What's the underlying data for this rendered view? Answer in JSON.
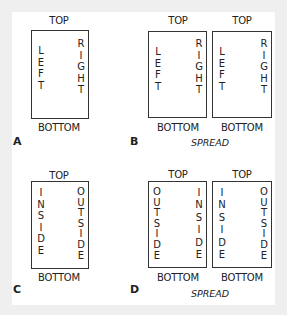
{
  "diagrams": {
    "a": {
      "label": "A",
      "top": "TOP",
      "bottom": "BOTTOM",
      "pages": [
        {
          "left": [
            "L",
            "E",
            "F",
            "T"
          ],
          "right": [
            "R",
            "I",
            "G",
            "H",
            "T"
          ]
        }
      ]
    },
    "b": {
      "label": "B",
      "caption": "SPREAD",
      "pages": [
        {
          "top": "TOP",
          "bottom": "BOTTOM",
          "left": [
            "L",
            "E",
            "F",
            "T"
          ],
          "right": [
            "R",
            "I",
            "G",
            "H",
            "T"
          ]
        },
        {
          "top": "TOP",
          "bottom": "BOTTOM",
          "left": [
            "L",
            "E",
            "F",
            "T"
          ],
          "right": [
            "R",
            "I",
            "G",
            "H",
            "T"
          ]
        }
      ]
    },
    "c": {
      "label": "C",
      "top": "TOP",
      "bottom": "BOTTOM",
      "pages": [
        {
          "left": [
            "I",
            "N",
            "S",
            "I",
            "D",
            "E"
          ],
          "right": [
            "O",
            "U",
            "T",
            "S",
            "I",
            "D",
            "E"
          ]
        }
      ]
    },
    "d": {
      "label": "D",
      "caption": "SPREAD",
      "pages": [
        {
          "top": "TOP",
          "bottom": "BOTTOM",
          "left": [
            "O",
            "U",
            "T",
            "S",
            "I",
            "D",
            "E"
          ],
          "right": [
            "I",
            "N",
            "S",
            "I",
            "D",
            "E"
          ]
        },
        {
          "top": "TOP",
          "bottom": "BOTTOM",
          "left": [
            "I",
            "N",
            "S",
            "I",
            "D",
            "E"
          ],
          "right": [
            "O",
            "U",
            "T",
            "S",
            "I",
            "D",
            "E"
          ]
        }
      ]
    }
  }
}
